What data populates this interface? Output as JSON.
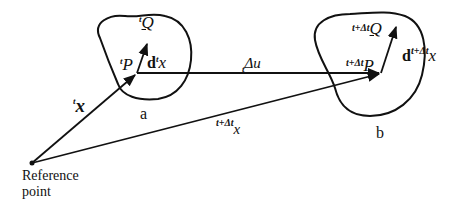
{
  "diagram": {
    "title": "",
    "bodies": [
      {
        "id": "a",
        "label": "a"
      },
      {
        "id": "b",
        "label": "b"
      }
    ],
    "reference_point": {
      "line1": "Reference",
      "line2": "point"
    },
    "labels": {
      "tQ_sup": "t",
      "tQ_main": "Q",
      "tP_sup": "t",
      "tP_main": "P",
      "dtx_bold": "d",
      "dtx_sup": "t",
      "dtx_main": "x",
      "tx_sup": "t",
      "tx_main": "x",
      "du_sub": "t",
      "du_main": "Δu",
      "ttx_sup": "t+Δt",
      "ttx_main": "x",
      "ttQ_sup": "t+Δt",
      "ttQ_main": "Q",
      "ttP_sup": "t+Δt",
      "ttP_main": "P",
      "dttx_bold": "d",
      "dttx_sup": "t+Δt",
      "dttx_main": "x"
    },
    "colors": {
      "stroke": "#111111",
      "background": "#ffffff"
    }
  }
}
